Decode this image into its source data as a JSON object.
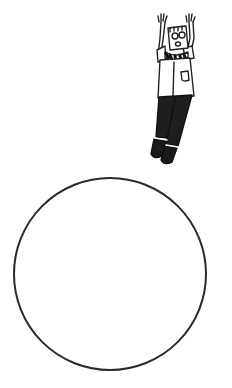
{
  "scene": {
    "description": "Cartoon man with glasses and striped tie, arms raised, floating above an empty circle",
    "background_color": "#ffffff",
    "line_color": "#222222"
  },
  "figure": {
    "name": "cartoon-man",
    "pose": "arms-raised-floating",
    "features": [
      "glasses",
      "striped-tie",
      "shirt-pocket",
      "dark-pants",
      "black-shoes"
    ]
  },
  "circle": {
    "cx": 110,
    "cy": 274,
    "r": 96,
    "stroke": "#2a2a2a",
    "stroke_width": 2
  }
}
